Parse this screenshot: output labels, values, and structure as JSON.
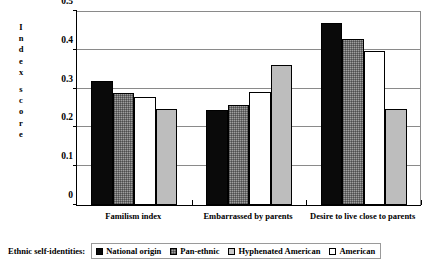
{
  "chart_data": {
    "type": "bar",
    "title": "",
    "subtitle": "",
    "xlabel": "",
    "ylabel": "Index score",
    "ylim": [
      0,
      0.5
    ],
    "ytick_labels": [
      "0",
      "0.1",
      "0.2",
      "0.3",
      "0.4",
      "0.5"
    ],
    "ytick_values": [
      0,
      0.1,
      0.2,
      0.3,
      0.4,
      0.5
    ],
    "grid": "horizontal",
    "legend_position": "bottom",
    "legend_title": "Ethnic self-identities:",
    "categories": [
      "Familism index",
      "Embarrassed by parents",
      "Desire to live close to parents"
    ],
    "series": [
      {
        "name": "National origin",
        "color": "#0a0a0a",
        "values": [
          0.32,
          0.245,
          0.468
        ]
      },
      {
        "name": "Pan-ethnic",
        "color": "#9e9e9e",
        "values": [
          0.288,
          0.258,
          0.428
        ]
      },
      {
        "name": "American",
        "color": "#ffffff",
        "values": [
          0.278,
          0.292,
          0.398
        ]
      },
      {
        "name": "Hyphenated American",
        "color": "#bdbdbd",
        "values": [
          0.248,
          0.36,
          0.248
        ]
      }
    ],
    "legend_entries": [
      {
        "label": "National origin",
        "swatch": "black"
      },
      {
        "label": "Pan-ethnic",
        "swatch": "dark-hatch"
      },
      {
        "label": "Hyphenated American",
        "swatch": "light-gray"
      },
      {
        "label": "American",
        "swatch": "white"
      }
    ],
    "annotations": []
  },
  "axis": {
    "y_title_letters": [
      "I",
      "n",
      "d",
      "e",
      "x",
      "",
      "s",
      "c",
      "o",
      "r",
      "e"
    ]
  }
}
